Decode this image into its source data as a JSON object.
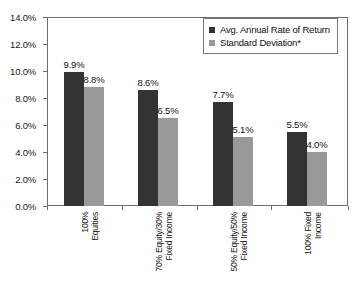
{
  "chart_data": {
    "type": "bar",
    "title": "",
    "xlabel": "",
    "ylabel": "",
    "ylim": [
      0,
      14
    ],
    "grid": false,
    "legend_position": "top-right",
    "categories": [
      "100% Equities",
      "70% Equity/30% Fixed Income",
      "50% Equity/50% Fixed Income",
      "100% Fixed Income"
    ],
    "category_lines": [
      [
        "100%",
        "Equities"
      ],
      [
        "70% Equity/30%",
        "Fixed Income"
      ],
      [
        "50% Equity/50%",
        "Fixed Income"
      ],
      [
        "100% Fixed",
        "Income"
      ]
    ],
    "series": [
      {
        "name": "Avg. Annual Rate of Return",
        "color": "#333333",
        "values": [
          9.9,
          8.6,
          7.7,
          5.5
        ],
        "labels": [
          "9.9%",
          "8.6%",
          "7.7%",
          "5.5%"
        ]
      },
      {
        "name": "Standard Deviation*",
        "color": "#999999",
        "values": [
          8.8,
          6.5,
          5.1,
          4.0
        ],
        "labels": [
          "8.8%",
          "6.5%",
          "5.1%",
          "4.0%"
        ]
      }
    ],
    "ytick_values": [
      0,
      2,
      4,
      6,
      8,
      10,
      12,
      14
    ],
    "ytick_labels": [
      "0.0%",
      "2.0%",
      "4.0%",
      "6.0%",
      "8.0%",
      "10.0%",
      "12.0%",
      "14.0%"
    ]
  },
  "legend": {
    "items": [
      {
        "label": "Avg. Annual Rate of Return",
        "color": "#333333"
      },
      {
        "label": "Standard Deviation*",
        "color": "#999999"
      }
    ]
  },
  "colors": {
    "series_dark": "#333333",
    "series_light": "#999999",
    "axis": "#6e6e6e",
    "text": "#111111",
    "background": "#ffffff"
  }
}
